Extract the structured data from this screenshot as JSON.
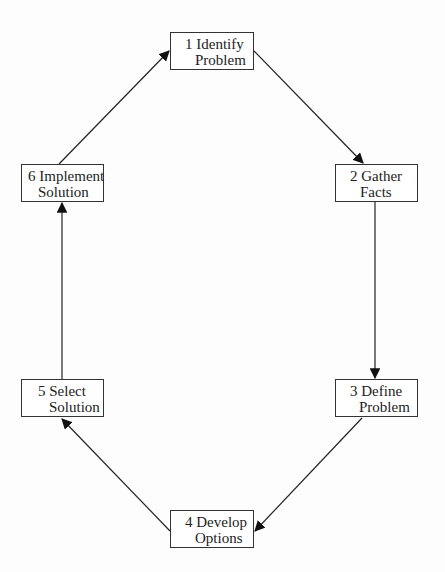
{
  "diagram": {
    "type": "cycle",
    "nodes": [
      {
        "id": "1",
        "line1": "1 Identify",
        "line2": "Problem"
      },
      {
        "id": "2",
        "line1": "2 Gather",
        "line2": "Facts"
      },
      {
        "id": "3",
        "line1": "3 Define",
        "line2": "Problem"
      },
      {
        "id": "4",
        "line1": "4 Develop",
        "line2": "Options"
      },
      {
        "id": "5",
        "line1": "5 Select",
        "line2": "Solution"
      },
      {
        "id": "6",
        "line1": "6 Implement",
        "line2": "Solution"
      }
    ],
    "edges": [
      {
        "from": "1",
        "to": "2"
      },
      {
        "from": "2",
        "to": "3"
      },
      {
        "from": "3",
        "to": "4"
      },
      {
        "from": "4",
        "to": "5"
      },
      {
        "from": "5",
        "to": "6"
      },
      {
        "from": "6",
        "to": "1"
      }
    ],
    "colors": {
      "stroke": "#222222",
      "background": "#fdfdfd"
    }
  }
}
